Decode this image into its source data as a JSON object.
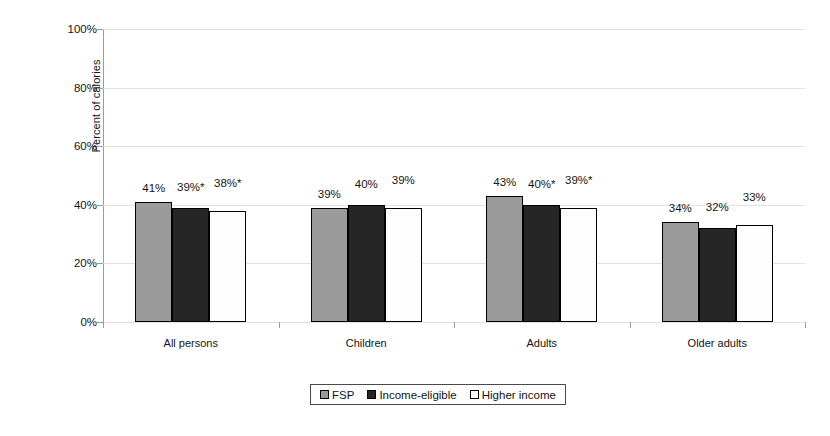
{
  "chart_data": {
    "type": "bar",
    "title": "",
    "xlabel": "",
    "ylabel": "Percent of calories",
    "ylim": [
      0,
      100
    ],
    "ytick_labels": [
      "0%",
      "20%",
      "40%",
      "60%",
      "80%",
      "100%"
    ],
    "ytick_values": [
      0,
      20,
      40,
      60,
      80,
      100
    ],
    "grid": true,
    "legend_position": "bottom",
    "categories": [
      "All persons",
      "Children",
      "Adults",
      "Older adults"
    ],
    "series": [
      {
        "name": "FSP",
        "color": "#9b9b9b",
        "values": [
          41,
          39,
          43,
          34
        ],
        "labels": [
          "41%",
          "39%",
          "43%",
          "34%"
        ]
      },
      {
        "name": "Income-eligible",
        "color": "#262626",
        "values": [
          39,
          40,
          40,
          32
        ],
        "labels": [
          "39%*",
          "40%",
          "40%*",
          "32%"
        ]
      },
      {
        "name": "Higher income",
        "color": "#fdfdfd",
        "values": [
          38,
          39,
          39,
          33
        ],
        "labels": [
          "38%*",
          "39%",
          "39%*",
          "33%"
        ]
      }
    ],
    "footnote_symbol": "*"
  },
  "legend": {
    "items": [
      {
        "label": "FSP",
        "swatch": "swatch-gray"
      },
      {
        "label": "Income-eligible",
        "swatch": "swatch-black"
      },
      {
        "label": "Higher income",
        "swatch": "swatch-white"
      }
    ]
  }
}
